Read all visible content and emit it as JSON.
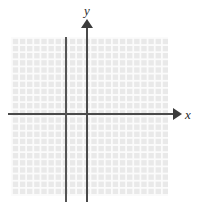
{
  "figure": {
    "name": "cartesian-coordinate-plane",
    "width": 201,
    "height": 212,
    "background_color": "#ffffff"
  },
  "grid": {
    "fill_color": "#e9e9e9",
    "line_color": "#fbfbfb",
    "cell_size_px": 7.15,
    "left_px": 11,
    "top_px": 37,
    "width_px": 157,
    "height_px": 159,
    "columns": 22,
    "rows": 22
  },
  "axes": {
    "color": "#4a4a4a",
    "x_axis": {
      "label": "x",
      "origin_y_px": 114,
      "start_x_px": 8,
      "end_x_px": 180,
      "arrow": "arrow-right"
    },
    "y_axis": {
      "label": "y",
      "origin_x_px": 87,
      "start_y_px": 20,
      "end_y_px": 202,
      "arrow": "arrow-up"
    }
  },
  "extra_lines": [
    {
      "name": "vertical-line",
      "orientation": "vertical",
      "x_px": 66,
      "top_px": 37,
      "bottom_px": 202,
      "color": "#555555"
    }
  ],
  "chart_data": {
    "type": "line",
    "title": "",
    "subtitle": "",
    "xlabel": "x",
    "ylabel": "y",
    "grid": true,
    "legend": "none",
    "xlim": [
      -11,
      11
    ],
    "ylim": [
      -11,
      11
    ],
    "xticks": [],
    "yticks": [],
    "tick_labels_shown": false,
    "series": [
      {
        "name": "vertical-line",
        "kind": "vertical-line",
        "x": -3,
        "values": []
      }
    ],
    "annotations": []
  }
}
